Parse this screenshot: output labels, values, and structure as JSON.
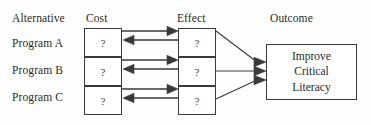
{
  "diagram": {
    "title_row": {
      "alternative": "Alternative",
      "cost": "Cost",
      "effect": "Effect",
      "outcome": "Outcome"
    },
    "rows": [
      {
        "label": "Program A",
        "cost": "?",
        "effect": "?"
      },
      {
        "label": "Program B",
        "cost": "?",
        "effect": "?"
      },
      {
        "label": "Program C",
        "cost": "?",
        "effect": "?"
      }
    ],
    "outcome_box": {
      "line1": "Improve",
      "line2": "Critical",
      "line3": "Literacy"
    },
    "colors": {
      "stroke": "#3a3a3a",
      "text": "#2b2b2b",
      "background": "#fefefe",
      "box_fill": "#ffffff"
    }
  }
}
